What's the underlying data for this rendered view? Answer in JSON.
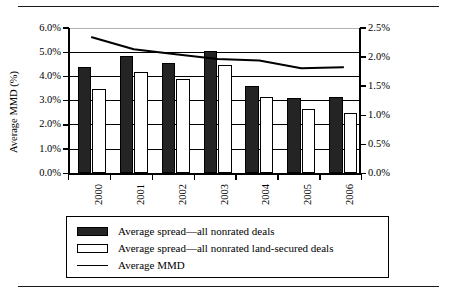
{
  "chart_data": {
    "type": "bar",
    "title": "",
    "subtitle": "",
    "categories": [
      "2000",
      "2001",
      "2002",
      "2003",
      "2004",
      "2005",
      "2006"
    ],
    "series": [
      {
        "name": "Average spread—all nonrated deals",
        "type": "bar",
        "axis": "right",
        "style": "dark-filled",
        "values": [
          1.83,
          2.02,
          1.9,
          2.1,
          1.51,
          1.3,
          1.32
        ],
        "values_left_scale": [
          4.4,
          4.85,
          4.56,
          5.05,
          3.62,
          3.11,
          3.17
        ]
      },
      {
        "name": "Average spread—all nonrated land-secured deals",
        "type": "bar",
        "axis": "right",
        "style": "white-outlined",
        "values": [
          1.45,
          1.75,
          1.62,
          1.87,
          1.32,
          1.1,
          1.05
        ],
        "values_left_scale": [
          3.48,
          4.2,
          3.89,
          4.49,
          3.17,
          2.64,
          2.51
        ]
      },
      {
        "name": "Average MMD",
        "type": "line",
        "axis": "left",
        "style": "black-line",
        "values": [
          5.62,
          5.12,
          4.92,
          4.72,
          4.66,
          4.34,
          4.38
        ]
      }
    ],
    "xlabel": "",
    "ylabel": "Average MMD (%)",
    "y2label": "Spreads (percentage points)",
    "ylim": [
      0.0,
      6.0
    ],
    "y2lim": [
      0.0,
      2.5
    ],
    "yticks": [
      "0.0%",
      "1.0%",
      "2.0%",
      "3.0%",
      "4.0%",
      "5.0%",
      "6.0%"
    ],
    "ytick_values": [
      0.0,
      1.0,
      2.0,
      3.0,
      4.0,
      5.0,
      6.0
    ],
    "y2ticks": [
      "0.0%",
      "0.5%",
      "1.0%",
      "1.5%",
      "2.0%",
      "2.5%"
    ],
    "y2tick_values": [
      0.0,
      0.5,
      1.0,
      1.5,
      2.0,
      2.5
    ],
    "grid": true,
    "grid_axis": "y",
    "legend_position": "bottom",
    "colors": {
      "bar_dark": "#242424",
      "bar_light": "#ffffff",
      "line": "#000000",
      "axis": "#000000",
      "grid": "#000000",
      "background": "#ffffff"
    }
  },
  "axes": {
    "left": {
      "title": "Average MMD (%)",
      "ticks": [
        "0.0%",
        "1.0%",
        "2.0%",
        "3.0%",
        "4.0%",
        "5.0%",
        "6.0%"
      ]
    },
    "right": {
      "title": "Spreads (percentage points)",
      "ticks": [
        "0.0%",
        "0.5%",
        "1.0%",
        "1.5%",
        "2.0%",
        "2.5%"
      ]
    },
    "bottom": {
      "ticks": [
        "2000",
        "2001",
        "2002",
        "2003",
        "2004",
        "2005",
        "2006"
      ]
    }
  },
  "legend": {
    "items": [
      {
        "label": "Average spread—all nonrated deals",
        "swatch": "dark-bar-swatch"
      },
      {
        "label": "Average spread—all nonrated land-secured deals",
        "swatch": "light-bar-swatch"
      },
      {
        "label": "Average MMD",
        "swatch": "line-swatch"
      }
    ]
  }
}
